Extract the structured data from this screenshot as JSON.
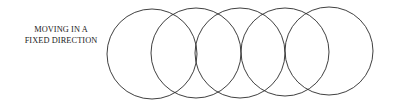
{
  "label": {
    "line1": "MOVING IN A",
    "line2": "FIXED DIRECTION"
  },
  "diagram": {
    "stroke_color": "#2a2a2a",
    "circles": [
      {
        "cx": 152,
        "cy": 54,
        "r": 45
      },
      {
        "cx": 196,
        "cy": 53,
        "r": 45
      },
      {
        "cx": 240,
        "cy": 53,
        "r": 45
      },
      {
        "cx": 285,
        "cy": 52,
        "r": 44
      },
      {
        "cx": 329,
        "cy": 51,
        "r": 44
      }
    ]
  }
}
